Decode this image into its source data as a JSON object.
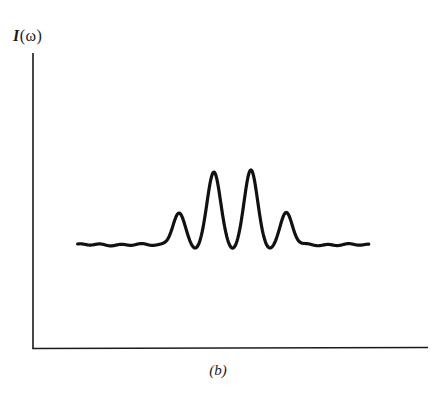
{
  "figure": {
    "y_axis_label": "I(ω)",
    "y_axis_label_parts": {
      "symbol": "I",
      "argument": "(ω)"
    },
    "caption": "(b)"
  },
  "colors": {
    "ink": "#1a1a1a",
    "background": "#ffffff"
  },
  "chart_data": {
    "type": "line",
    "title": "",
    "caption": "(b)",
    "xlabel": "",
    "ylabel": "I(ω)",
    "x_ticks": [],
    "y_ticks": [],
    "grid": false,
    "legend": null,
    "units": "arbitrary (normalized to axis height)",
    "xlim": [
      0,
      1
    ],
    "ylim": [
      0,
      1
    ],
    "series": [
      {
        "name": "I(ω)",
        "x": [
          0.113,
          0.2,
          0.3,
          0.33,
          0.36,
          0.383,
          0.39,
          0.412,
          0.43,
          0.445,
          0.47,
          0.485,
          0.5,
          0.515,
          0.535,
          0.552,
          0.57,
          0.585,
          0.6,
          0.623,
          0.63,
          0.655,
          0.68,
          0.75,
          0.85,
          0.848
        ],
        "y": [
          0.348,
          0.35,
          0.35,
          0.355,
          0.37,
          0.43,
          0.457,
          0.37,
          0.333,
          0.4,
          0.58,
          0.6,
          0.48,
          0.35,
          0.343,
          0.45,
          0.6,
          0.61,
          0.48,
          0.335,
          0.36,
          0.457,
          0.36,
          0.35,
          0.35,
          0.35
        ]
      }
    ],
    "peaks": [
      {
        "label": "outer-left",
        "x": 0.369,
        "y": 0.457
      },
      {
        "label": "inner-left",
        "x": 0.458,
        "y": 0.6
      },
      {
        "label": "inner-right",
        "x": 0.552,
        "y": 0.603
      },
      {
        "label": "outer-right",
        "x": 0.641,
        "y": 0.457
      }
    ],
    "baseline": 0.35
  }
}
